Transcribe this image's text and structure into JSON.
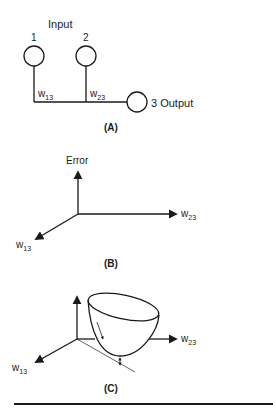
{
  "panelA": {
    "input_label": "Input",
    "node1_label": "1",
    "node2_label": "2",
    "weight1_base": "w",
    "weight1_sub": "13",
    "weight2_base": "w",
    "weight2_sub": "23",
    "output_label": "3 Output",
    "caption": "(A)"
  },
  "panelB": {
    "y_axis_label": "Error",
    "x_axis_base": "w",
    "x_axis_sub": "23",
    "z_axis_base": "w",
    "z_axis_sub": "13",
    "caption": "(B)"
  },
  "panelC": {
    "x_axis_base": "w",
    "x_axis_sub": "23",
    "z_axis_base": "w",
    "z_axis_sub": "13",
    "caption": "(C)"
  },
  "colors": {
    "stroke": "#1a1a1a",
    "background": "#ffffff"
  }
}
